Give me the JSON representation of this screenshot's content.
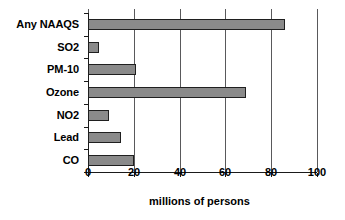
{
  "chart_data": {
    "type": "bar",
    "orientation": "horizontal",
    "title": "",
    "subtitle": "",
    "xlabel": "millions of persons",
    "ylabel": "",
    "categories": [
      "Any NAAQS",
      "SO2",
      "PM-10",
      "Ozone",
      "NO2",
      "Lead",
      "CO"
    ],
    "values": [
      86,
      5,
      21,
      69,
      9,
      14.5,
      20
    ],
    "series": [
      {
        "name": "persons exposed",
        "values": [
          86,
          5,
          21,
          69,
          9,
          14.5,
          20
        ]
      }
    ],
    "xlim": [
      0,
      100
    ],
    "xticks": [
      0,
      20,
      40,
      60,
      80,
      100
    ],
    "xticklabels": [
      "0",
      "20",
      "40",
      "60",
      "80",
      "100"
    ],
    "grid": true,
    "grid_axis": "x",
    "legend": false,
    "legend_position": "none",
    "bar_color": "#8a8a8a",
    "bar_edge_color": "#1f1f1f",
    "axis_color": "#1a1a1a",
    "gridline_color": "#59595b",
    "background_color": "#ffffff",
    "text_color": "#000000"
  }
}
